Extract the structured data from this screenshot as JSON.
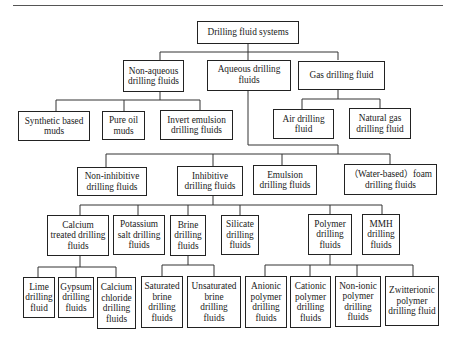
{
  "page": {
    "number": "172"
  },
  "diagram": {
    "title": "Drilling fluid systems",
    "nodes": {
      "root": "Drilling fluid systems",
      "non_aqueous": "Non-aqueous drilling fluids",
      "aqueous": "Aqueous drilling fluids",
      "gas": "Gas drilling fluid",
      "synthetic": "Synthetic based muds",
      "pure_oil": "Pure oil muds",
      "invert_emulsion": "Invert emulsion drilling fluids",
      "air": "Air drilling fluid",
      "natural_gas": "Natural gas drilling fluid",
      "non_inhibitive": "Non-inhibitive drilling fluids",
      "inhibitive": "Inhibitive drilling fluids",
      "emulsion": "Emulsion drilling fluids",
      "foam": "（Water-based）foam drilling fluids",
      "calcium_treated": "Calcium treated drilling fluids",
      "potassium": "Potassium salt drilling fluids",
      "brine": "Brine drilling fluids",
      "silicate": "Silicate drilling fluids",
      "polymer": "Polymer drilling fluids",
      "mmh": "MMH drilling fluids",
      "lime": "Lime drilling fluid",
      "gypsum": "Gypsum drilling fluids",
      "calcium_chloride": "Calcium chloride drilling fluids",
      "saturated_brine": "Saturated brine drilling fluids",
      "unsaturated_brine": "Unsaturated brine drilling fluids",
      "anionic": "Anionic polymer drilling fluids",
      "cationic": "Cationic polymer drilling fluids",
      "non_ionic": "Non-ionic polymer drilling fluids",
      "zwitterionic": "Zwitterionic polymer drilling fluid"
    },
    "edges": [
      [
        "root",
        "non_aqueous"
      ],
      [
        "root",
        "aqueous"
      ],
      [
        "root",
        "gas"
      ],
      [
        "non_aqueous",
        "synthetic"
      ],
      [
        "non_aqueous",
        "pure_oil"
      ],
      [
        "non_aqueous",
        "invert_emulsion"
      ],
      [
        "gas",
        "air"
      ],
      [
        "gas",
        "natural_gas"
      ],
      [
        "aqueous",
        "non_inhibitive"
      ],
      [
        "aqueous",
        "inhibitive"
      ],
      [
        "aqueous",
        "emulsion"
      ],
      [
        "aqueous",
        "foam"
      ],
      [
        "inhibitive",
        "calcium_treated"
      ],
      [
        "inhibitive",
        "potassium"
      ],
      [
        "inhibitive",
        "brine"
      ],
      [
        "inhibitive",
        "silicate"
      ],
      [
        "inhibitive",
        "polymer"
      ],
      [
        "inhibitive",
        "mmh"
      ],
      [
        "calcium_treated",
        "lime"
      ],
      [
        "calcium_treated",
        "gypsum"
      ],
      [
        "calcium_treated",
        "calcium_chloride"
      ],
      [
        "brine",
        "saturated_brine"
      ],
      [
        "brine",
        "unsaturated_brine"
      ],
      [
        "polymer",
        "anionic"
      ],
      [
        "polymer",
        "cationic"
      ],
      [
        "polymer",
        "non_ionic"
      ],
      [
        "polymer",
        "zwitterionic"
      ]
    ]
  }
}
